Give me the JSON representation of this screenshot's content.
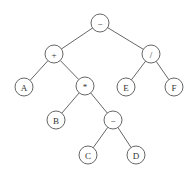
{
  "diagram": {
    "type": "expression-tree",
    "node_radius": 9,
    "stroke_color": "#555555",
    "nodes": [
      {
        "id": "root",
        "label": "−",
        "x": 100,
        "y": 23
      },
      {
        "id": "plus",
        "label": "+",
        "x": 54,
        "y": 54
      },
      {
        "id": "div",
        "label": "/",
        "x": 151,
        "y": 54
      },
      {
        "id": "A",
        "label": "A",
        "x": 24,
        "y": 87
      },
      {
        "id": "mul",
        "label": "*",
        "x": 85,
        "y": 86
      },
      {
        "id": "E",
        "label": "E",
        "x": 126,
        "y": 87
      },
      {
        "id": "F",
        "label": "F",
        "x": 174,
        "y": 87
      },
      {
        "id": "B",
        "label": "B",
        "x": 56,
        "y": 120
      },
      {
        "id": "minus",
        "label": "−",
        "x": 113,
        "y": 120
      },
      {
        "id": "C",
        "label": "C",
        "x": 88,
        "y": 155
      },
      {
        "id": "D",
        "label": "D",
        "x": 136,
        "y": 155
      }
    ],
    "edges": [
      [
        "root",
        "plus"
      ],
      [
        "root",
        "div"
      ],
      [
        "plus",
        "A"
      ],
      [
        "plus",
        "mul"
      ],
      [
        "div",
        "E"
      ],
      [
        "div",
        "F"
      ],
      [
        "mul",
        "B"
      ],
      [
        "mul",
        "minus"
      ],
      [
        "minus",
        "C"
      ],
      [
        "minus",
        "D"
      ]
    ]
  }
}
